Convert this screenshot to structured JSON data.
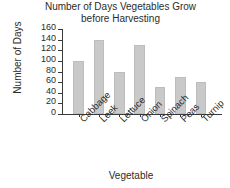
{
  "chart_data": {
    "type": "bar",
    "title": "Number of Days Vegetables Grow\nbefore Harvesting",
    "title_line1": "Number of Days Vegetables Grow",
    "title_line2": "before Harvesting",
    "xlabel": "Vegetable",
    "ylabel": "Number of Days",
    "categories": [
      "Cabbage",
      "Leek",
      "Lettuce",
      "Onion",
      "Spinach",
      "Peas",
      "Turnip"
    ],
    "values": [
      100,
      140,
      80,
      130,
      50,
      70,
      60
    ],
    "ylim": [
      0,
      160
    ],
    "ytick_labels": [
      "0",
      "20",
      "40",
      "60",
      "80",
      "100",
      "120",
      "140",
      "160"
    ],
    "ytick_values": [
      0,
      20,
      40,
      60,
      80,
      100,
      120,
      140,
      160
    ],
    "grid": false,
    "legend": false,
    "bar_color": "#c9c9c9",
    "bar_edge_color": "#bdbdbd",
    "axis_color": "#3a3a3a",
    "text_color": "#2b2b2b",
    "background_color": "#ffffff"
  }
}
